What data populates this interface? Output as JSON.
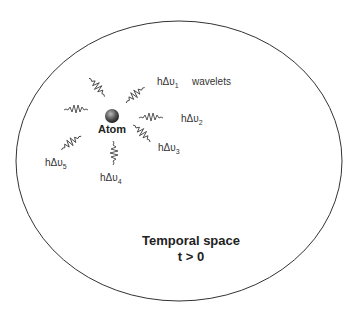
{
  "diagram": {
    "boundary": {
      "shape": "ellipse",
      "stroke": "#333333"
    },
    "atom": {
      "label": "Atom",
      "color": "#555555"
    },
    "wavelets_label": "wavelets",
    "wavelets": [
      {
        "id": 1,
        "label": "hΔυ",
        "sub": "1"
      },
      {
        "id": 2,
        "label": "hΔυ",
        "sub": "2"
      },
      {
        "id": 3,
        "label": "hΔυ",
        "sub": "3"
      },
      {
        "id": 4,
        "label": "hΔυ",
        "sub": "4"
      },
      {
        "id": 5,
        "label": "hΔυ",
        "sub": "5"
      }
    ],
    "region_title": "Temporal space",
    "region_condition": "t > 0"
  }
}
